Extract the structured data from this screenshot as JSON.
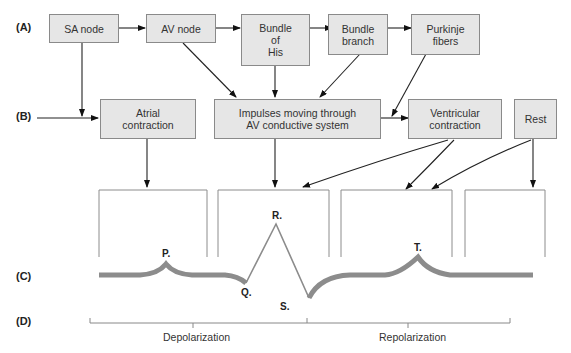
{
  "row_labels": {
    "a": "(A)",
    "b": "(B)",
    "c": "(C)",
    "d": "(D)"
  },
  "row_a_boxes": [
    {
      "label": "SA node"
    },
    {
      "label": "AV node"
    },
    {
      "label": "Bundle\nof\nHis"
    },
    {
      "label": "Bundle\nbranch"
    },
    {
      "label": "Purkinje\nfibers"
    }
  ],
  "row_b_boxes": [
    {
      "label": "Atrial\ncontraction"
    },
    {
      "label": "Impulses moving through\nAV conductive system"
    },
    {
      "label": "Ventricular\ncontraction"
    },
    {
      "label": "Rest"
    }
  ],
  "waveform": {
    "labels": {
      "p": "P.",
      "q": "Q.",
      "r": "R.",
      "s": "S.",
      "t": "T."
    },
    "color": "#8c8c8c"
  },
  "phases": {
    "depolarization": "Depolarization",
    "repolarization": "Repolarization"
  }
}
